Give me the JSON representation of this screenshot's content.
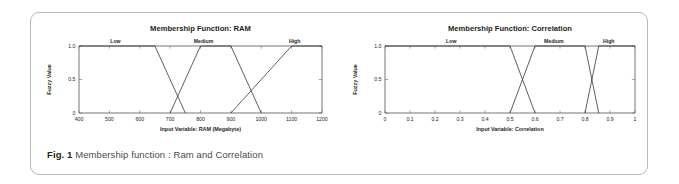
{
  "figure": {
    "number_label": "Fig. 1",
    "caption": "Membership function : Ram and Correlation"
  },
  "chart_data": [
    {
      "id": "ram",
      "type": "line",
      "title": "Membership Function: RAM",
      "xlabel": "Input Variable: RAM (Megabyte)",
      "ylabel": "Fuzzy Value",
      "xlim": [
        400,
        1200
      ],
      "ylim": [
        0,
        1.0
      ],
      "xticks": [
        400,
        500,
        600,
        700,
        800,
        900,
        1000,
        1100,
        1200
      ],
      "xticklabels": [
        "400",
        "500",
        "600",
        "700",
        "800",
        "900",
        "1000",
        "1100",
        "1200"
      ],
      "yticks": [
        0,
        0.5,
        1.0
      ],
      "yticklabels": [
        "0",
        "0.5",
        "1.0"
      ],
      "grid": false,
      "legend": "inline-terms",
      "series": [
        {
          "name": "Low",
          "label_x": 520,
          "points": [
            [
              400,
              1.0
            ],
            [
              650,
              1.0
            ],
            [
              750,
              0
            ]
          ]
        },
        {
          "name": "Medium",
          "label_x": 810,
          "points": [
            [
              700,
              0
            ],
            [
              800,
              1.0
            ],
            [
              900,
              1.0
            ],
            [
              1000,
              0
            ]
          ]
        },
        {
          "name": "High",
          "label_x": 1110,
          "points": [
            [
              900,
              0
            ],
            [
              1100,
              1.0
            ],
            [
              1200,
              1.0
            ]
          ]
        }
      ]
    },
    {
      "id": "correlation",
      "type": "line",
      "title": "Membership Function: Correlation",
      "xlabel": "Input Variable: Correlation",
      "ylabel": "Fuzzy Value",
      "xlim": [
        0,
        1
      ],
      "ylim": [
        0,
        1.0
      ],
      "xticks": [
        0,
        0.1,
        0.2,
        0.3,
        0.4,
        0.5,
        0.6,
        0.7,
        0.8,
        0.9,
        1
      ],
      "xticklabels": [
        "0",
        "0.1",
        "0.2",
        "0.3",
        "0.4",
        "0.5",
        "0.6",
        "0.7",
        "0.8",
        "0.9",
        "1"
      ],
      "yticks": [
        0,
        0.5,
        1.0
      ],
      "yticklabels": [
        "0",
        "0.5",
        "1.0"
      ],
      "grid": false,
      "legend": "inline-terms",
      "series": [
        {
          "name": "Low",
          "label_x": 0.265,
          "points": [
            [
              0,
              1.0
            ],
            [
              0.5,
              1.0
            ],
            [
              0.6,
              0
            ]
          ]
        },
        {
          "name": "Medium",
          "label_x": 0.675,
          "points": [
            [
              0.5,
              0
            ],
            [
              0.6,
              1.0
            ],
            [
              0.8,
              1.0
            ],
            [
              0.855,
              0
            ]
          ]
        },
        {
          "name": "High",
          "label_x": 0.895,
          "points": [
            [
              0.8,
              0
            ],
            [
              0.855,
              1.0
            ],
            [
              1,
              1.0
            ]
          ]
        }
      ]
    }
  ]
}
